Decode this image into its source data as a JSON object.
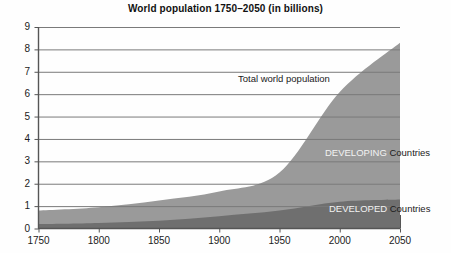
{
  "chart_data": {
    "type": "area",
    "title": "World population 1750–2050 (in billions)",
    "xlabel": "",
    "ylabel": "",
    "xlim": [
      1750,
      2050
    ],
    "ylim": [
      0,
      9
    ],
    "grid": true,
    "stacked": true,
    "legend_position": "in-plot",
    "x_ticks": [
      "1750",
      "1800",
      "1850",
      "1900",
      "1950",
      "2000",
      "2050"
    ],
    "y_ticks": [
      "0",
      "1",
      "2",
      "3",
      "4",
      "5",
      "6",
      "7",
      "8",
      "9"
    ],
    "x": [
      1750,
      1800,
      1850,
      1900,
      1950,
      2000,
      2050
    ],
    "series": [
      {
        "name": "DEVELOPED",
        "suffix": "Countries",
        "color": "#6f6f6f",
        "values": [
          0.2,
          0.25,
          0.35,
          0.55,
          0.8,
          1.2,
          1.3
        ]
      },
      {
        "name": "DEVELOPING",
        "suffix": "Countries",
        "color": "#9a9a9a",
        "values": [
          0.6,
          0.7,
          0.9,
          1.1,
          1.7,
          4.9,
          7.0
        ]
      }
    ],
    "total_series": {
      "name": "Total world population",
      "values": [
        0.8,
        0.95,
        1.25,
        1.65,
        2.5,
        6.1,
        8.3
      ]
    },
    "annotations": [
      {
        "text": "Total world population",
        "x": 1935,
        "y": 6.4
      },
      {
        "text": "DEVELOPING",
        "x": 1985,
        "y": 3.1
      },
      {
        "text": "DEVELOPED",
        "x": 1985,
        "y": 0.75
      }
    ],
    "axis_color": "#555555",
    "grid_color": "#777777",
    "background": "#fefefe"
  }
}
